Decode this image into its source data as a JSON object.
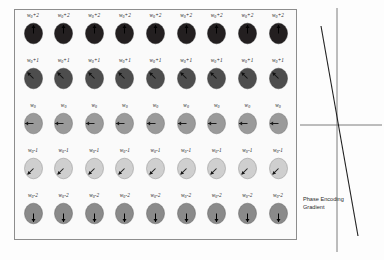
{
  "figure": {
    "panel": {
      "columns": 9,
      "rows": [
        {
          "id": "row-plus2",
          "label_html": "w<sub>0</sub>+2",
          "label_text": "w0+2",
          "angle_deg": 90,
          "fill": "#231f20",
          "arrow_color": "#000000",
          "outline": "#1a1a1a"
        },
        {
          "id": "row-plus1",
          "label_html": "w<sub>0</sub>+1",
          "label_text": "w0+1",
          "angle_deg": 135,
          "fill": "#4d4d4d",
          "arrow_color": "#111111",
          "outline": "#3a3a3a"
        },
        {
          "id": "row-zero",
          "label_html": "w<sub>0</sub>",
          "label_text": "w0",
          "angle_deg": 180,
          "fill": "#9a9a9a",
          "arrow_color": "#1a1a1a",
          "outline": "#6f6f6f"
        },
        {
          "id": "row-minus1",
          "label_html": "w<sub>0</sub>-1",
          "label_text": "w0-1",
          "angle_deg": 225,
          "fill": "#cfcfcf",
          "arrow_color": "#1a1a1a",
          "outline": "#8a8a8a"
        },
        {
          "id": "row-minus2",
          "label_html": "w<sub>0</sub>-2",
          "label_text": "w0-2",
          "angle_deg": 270,
          "fill": "#8a8a8a",
          "arrow_color": "#000000",
          "outline": "#5e5e5e"
        }
      ]
    },
    "gradient": {
      "caption_line1": "Phase Encoding",
      "caption_line2": "Gradient",
      "axis_color": "#6e6e6e",
      "line_color": "#1f1f1f"
    }
  },
  "chart_data": {
    "type": "line",
    "title": "Phase Encoding Gradient",
    "xlabel": "",
    "ylabel": "",
    "grid": false,
    "legend": "none",
    "axes": {
      "origin_x_px": 37,
      "origin_y_px": 117,
      "vertical_axis": true,
      "horizontal_axis": true
    },
    "x": [
      -24,
      30
    ],
    "y": [
      110,
      -120
    ],
    "series": [
      {
        "name": "gradient",
        "x": [
          -24,
          30
        ],
        "values": [
          110,
          -120
        ]
      }
    ]
  }
}
